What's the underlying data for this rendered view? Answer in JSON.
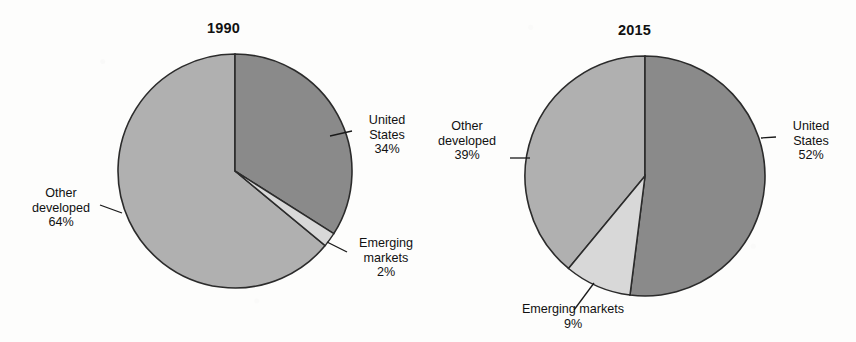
{
  "figure": {
    "background_color": "#fdfdfc",
    "leader_line_color": "#1a1a1a",
    "slice_edge_color": "#2b2b2b"
  },
  "palette": {
    "united_states": "#8a8a8a",
    "other_developed": "#b0b0b0",
    "emerging_markets": "#d8d8d8"
  },
  "chart_data": [
    {
      "type": "pie",
      "title": "1990",
      "center": [
        235,
        171
      ],
      "radius": 117,
      "start_angle_deg": 0,
      "direction": "clockwise",
      "labels": [
        "United States",
        "Emerging markets",
        "Other developed"
      ],
      "values": [
        34,
        2,
        64
      ],
      "value_suffix": "%",
      "colors": [
        "#8a8a8a",
        "#d8d8d8",
        "#b0b0b0"
      ],
      "slices": [
        {
          "label": "United States",
          "value": 34,
          "display": "34%",
          "color": "#8a8a8a",
          "a0": 0,
          "a1": 122.4
        },
        {
          "label": "Emerging markets",
          "value": 2,
          "display": "2%",
          "color": "#d8d8d8",
          "a0": 122.4,
          "a1": 129.6
        },
        {
          "label": "Other developed",
          "value": 64,
          "display": "64%",
          "color": "#b0b0b0",
          "a0": 129.6,
          "a1": 360
        }
      ]
    },
    {
      "type": "pie",
      "title": "2015",
      "center": [
        645,
        176
      ],
      "radius": 120,
      "start_angle_deg": 0,
      "direction": "clockwise",
      "labels": [
        "United States",
        "Emerging markets",
        "Other developed"
      ],
      "values": [
        52,
        9,
        39
      ],
      "value_suffix": "%",
      "colors": [
        "#8a8a8a",
        "#d8d8d8",
        "#b0b0b0"
      ],
      "slices": [
        {
          "label": "United States",
          "value": 52,
          "display": "52%",
          "color": "#8a8a8a",
          "a0": 0,
          "a1": 187.2
        },
        {
          "label": "Emerging markets",
          "value": 9,
          "display": "9%",
          "color": "#d8d8d8",
          "a0": 187.2,
          "a1": 219.6
        },
        {
          "label": "Other developed",
          "value": 39,
          "display": "39%",
          "color": "#b0b0b0",
          "a0": 219.6,
          "a1": 360
        }
      ]
    }
  ],
  "chart1990": {
    "title": "1990",
    "us_label_line1": "United",
    "us_label_line2": "States",
    "us_value": "34%",
    "em_label_line1": "Emerging",
    "em_label_line2": "markets",
    "em_value": "2%",
    "od_label_line1": "Other",
    "od_label_line2": "developed",
    "od_value": "64%"
  },
  "chart2015": {
    "title": "2015",
    "us_label_line1": "United",
    "us_label_line2": "States",
    "us_value": "52%",
    "em_label_line1": "Emerging markets",
    "em_value": "9%",
    "od_label_line1": "Other",
    "od_label_line2": "developed",
    "od_value": "39%"
  }
}
